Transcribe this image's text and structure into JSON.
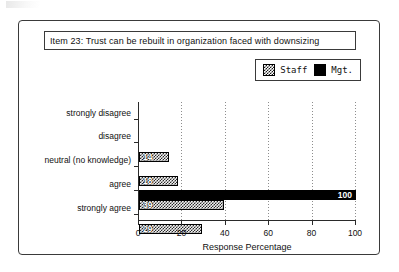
{
  "figure": {
    "title": "Item 23:  Trust can be rebuilt in organization faced with downsizing"
  },
  "legend": {
    "entries": [
      {
        "label": "Staff",
        "swatch": "checkered-swatch-icon",
        "color": "#2a2a2a"
      },
      {
        "label": "Mgt.",
        "swatch": "solid-black-swatch-icon",
        "color": "#000000"
      }
    ]
  },
  "chart_data": {
    "type": "bar",
    "orientation": "horizontal",
    "title": "Item 23:  Trust can be rebuilt in organization faced with downsizing",
    "xlabel": "Response Percentage",
    "ylabel": "",
    "categories": [
      "strongly disagree",
      "disagree",
      "neutral (no knowledge)",
      "agree",
      "strongly agree"
    ],
    "series": [
      {
        "name": "Mgt.",
        "values": [
          0,
          0,
          0,
          100,
          0
        ]
      },
      {
        "name": "Staff",
        "values": [
          0,
          14,
          18,
          39,
          29
        ]
      }
    ],
    "value_labels": {
      "Mgt.": [
        "",
        "",
        "",
        "100",
        ""
      ],
      "Staff": [
        "",
        "14",
        "18",
        "39",
        "29"
      ]
    },
    "xlim": [
      0,
      100
    ],
    "xticks": [
      0,
      20,
      40,
      60,
      80,
      100
    ],
    "xtick_labels": [
      "0",
      "20",
      "40",
      "60",
      "80",
      "100"
    ],
    "gridlines": [
      20,
      40,
      60,
      80,
      100
    ],
    "grid": true,
    "legend_position": "top-right"
  }
}
